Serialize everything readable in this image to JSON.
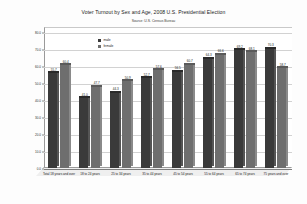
{
  "chart_data": {
    "type": "bar",
    "title": "Voter Turnout by Sex and Age, 2008 U.S. Presidential Election",
    "subtitle": "Source: U.S. Census Bureau",
    "xlabel": "",
    "ylabel": "",
    "ylim": [
      0.0,
      80.0
    ],
    "ytick_labels": [
      "80.0",
      "70.0",
      "60.0",
      "50.0",
      "40.0",
      "30.0",
      "20.0",
      "10.0",
      "0.0"
    ],
    "ytick_values": [
      80.0,
      70.0,
      60.0,
      50.0,
      40.0,
      30.0,
      20.0,
      10.0,
      0.0
    ],
    "grid": true,
    "legend_position": "upper-left-inside",
    "categories": [
      "Total 18 years and over",
      "18 to 24 years",
      "25 to 34 years",
      "35 to 44 years",
      "45 to 54 years",
      "55 to 64 years",
      "65 to 74 years",
      "75 years and over"
    ],
    "series": [
      {
        "name": "male",
        "color": "#3a3a3a",
        "values": [
          55.7,
          41.0,
          44.3,
          52.7,
          56.5,
          64.3,
          69.2,
          70.3
        ],
        "labels": [
          "55.7",
          "41.0",
          "44.3",
          "52.7",
          "56.5",
          "64.3",
          "69.2",
          "70.3"
        ]
      },
      {
        "name": "female",
        "color": "#6e6e6e",
        "values": [
          60.4,
          47.7,
          50.9,
          57.6,
          60.7,
          66.6,
          68.1,
          58.7
        ],
        "labels": [
          "60.4",
          "47.7",
          "50.9",
          "57.6",
          "60.7",
          "66.6",
          "68.1",
          "58.7"
        ]
      }
    ]
  },
  "legend": {
    "items": [
      {
        "label": "male",
        "color": "#3a3a3a"
      },
      {
        "label": "female",
        "color": "#6e6e6e"
      }
    ]
  },
  "colors": {
    "male": "#3a3a3a",
    "male_top": "#2a2a2a",
    "male_side": "#555555",
    "female": "#6e6e6e",
    "female_top": "#5a5a5a",
    "female_side": "#8a8a8a",
    "background": "#fdfdfd",
    "plot_background": "#ffffff",
    "gridline": "#d2d2d2",
    "axis": "#7d7d7d",
    "text": "#1b1b1b"
  }
}
